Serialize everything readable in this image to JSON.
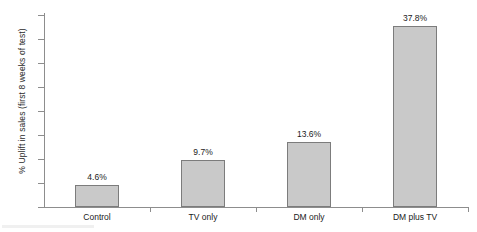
{
  "chart_data": {
    "type": "bar",
    "title": "",
    "xlabel": "",
    "ylabel": "% Uplift in sales (first 8 weeks of test)",
    "categories": [
      "Control",
      "TV only",
      "DM only",
      "DM plus TV"
    ],
    "values": [
      4.6,
      9.7,
      13.6,
      37.8
    ],
    "value_labels": [
      "4.6%",
      "9.7%",
      "13.6%",
      "37.8%"
    ],
    "ylim": [
      0,
      40
    ],
    "ytick_values": [
      0,
      5,
      10,
      15,
      20,
      25,
      30,
      35,
      40
    ],
    "ytick_labels": [
      "0",
      "5",
      "10",
      "15",
      "20",
      "25",
      "30",
      "35",
      "40"
    ],
    "grid": false,
    "legend": false,
    "bar_color": "#c9c9c9",
    "bar_border_color": "#7c7c7c",
    "axis_color": "#8d8d8d",
    "text_color": "#1a1a1a"
  }
}
